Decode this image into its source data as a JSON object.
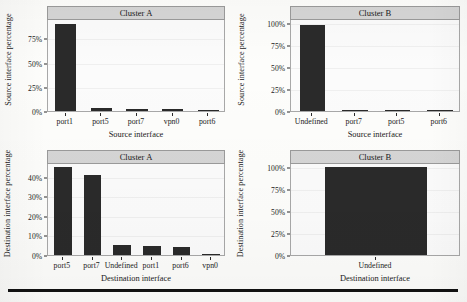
{
  "figure": {
    "panels": [
      {
        "id": "top-left",
        "strip_title": "Cluster A",
        "ylabel": "Source interface percentage",
        "xlabel": "Source interface",
        "yticks": [
          "0%",
          "25%",
          "50%",
          "75%"
        ],
        "categories": [
          "port1",
          "port5",
          "port7",
          "vpn0",
          "port6"
        ],
        "values": [
          90.0,
          2.6,
          2.2,
          2.0,
          0.8
        ]
      },
      {
        "id": "top-right",
        "strip_title": "Cluster B",
        "ylabel": "Source interface percentage",
        "xlabel": "Source interface",
        "yticks": [
          "0%",
          "25%",
          "50%",
          "75%",
          "100%"
        ],
        "categories": [
          "Undefined",
          "port7",
          "port5",
          "port6"
        ],
        "values": [
          98.5,
          0.6,
          0.6,
          0.1
        ]
      },
      {
        "id": "bottom-left",
        "strip_title": "Cluster A",
        "ylabel": "Destination interface percentage",
        "xlabel": "Destination interface",
        "yticks": [
          "0%",
          "10%",
          "20%",
          "30%",
          "40%"
        ],
        "categories": [
          "port5",
          "port7",
          "Undefined",
          "port1",
          "port6",
          "vpn0"
        ],
        "values": [
          45.0,
          41.0,
          5.0,
          4.5,
          4.0,
          0.6
        ]
      },
      {
        "id": "bottom-right",
        "strip_title": "Cluster B",
        "ylabel": "Destination interface percentage",
        "xlabel": "Destination interface",
        "yticks": [
          "0%",
          "25%",
          "50%",
          "75%",
          "100%"
        ],
        "categories": [
          "Undefined"
        ],
        "values": [
          100.0
        ]
      }
    ],
    "rule_color": "#111111"
  },
  "chart_data": [
    {
      "type": "bar",
      "title": "Cluster A",
      "xlabel": "Source interface",
      "ylabel": "Source interface percentage",
      "categories": [
        "port1",
        "port5",
        "port7",
        "vpn0",
        "port6"
      ],
      "values": [
        90.0,
        2.6,
        2.2,
        2.0,
        0.8
      ],
      "ytick_labels": [
        "0%",
        "25%",
        "50%",
        "75%"
      ],
      "ylim": [
        0,
        95
      ],
      "grid": true,
      "legend": "none"
    },
    {
      "type": "bar",
      "title": "Cluster B",
      "xlabel": "Source interface",
      "ylabel": "Source interface percentage",
      "categories": [
        "Undefined",
        "port7",
        "port5",
        "port6"
      ],
      "values": [
        98.5,
        0.6,
        0.6,
        0.1
      ],
      "ytick_labels": [
        "0%",
        "25%",
        "50%",
        "75%",
        "100%"
      ],
      "ylim": [
        0,
        105
      ],
      "grid": true,
      "legend": "none"
    },
    {
      "type": "bar",
      "title": "Cluster A",
      "xlabel": "Destination interface",
      "ylabel": "Destination interface percentage",
      "categories": [
        "port5",
        "port7",
        "Undefined",
        "port1",
        "port6",
        "vpn0"
      ],
      "values": [
        45.0,
        41.0,
        5.0,
        4.5,
        4.0,
        0.6
      ],
      "ytick_labels": [
        "0%",
        "10%",
        "20%",
        "30%",
        "40%"
      ],
      "ylim": [
        0,
        47
      ],
      "grid": true,
      "legend": "none"
    },
    {
      "type": "bar",
      "title": "Cluster B",
      "xlabel": "Destination interface",
      "ylabel": "Destination interface percentage",
      "categories": [
        "Undefined"
      ],
      "values": [
        100.0
      ],
      "ytick_labels": [
        "0%",
        "25%",
        "50%",
        "75%",
        "100%"
      ],
      "ylim": [
        0,
        105
      ],
      "grid": true,
      "legend": "none"
    }
  ]
}
